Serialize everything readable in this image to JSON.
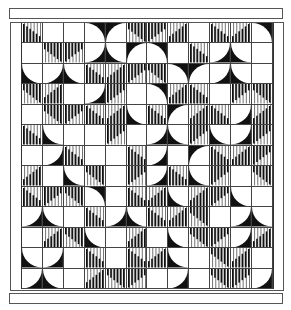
{
  "artwork": {
    "description": "Black and white geometric quilt pattern: grid of square tiles with quarter circles and vertical bar motifs",
    "columns": 12,
    "rows": 13,
    "colors": {
      "ink": "#111111",
      "paper": "#ffffff",
      "line": "#444444"
    },
    "tile_legend": {
      "0": "blank",
      "1": "quarter-circle-black-corner-top-left",
      "2": "quarter-circle-black-corner-top-right",
      "3": "quarter-circle-black-corner-bottom-right",
      "4": "quarter-circle-black-corner-bottom-left",
      "5": "bars-rising-left",
      "6": "bars-rising-right",
      "7": "bars-hanging-left",
      "8": "bars-hanging-right"
    },
    "tiles": [
      [
        5,
        0,
        0,
        2,
        1,
        7,
        8,
        6,
        0,
        5,
        6,
        2
      ],
      [
        0,
        7,
        8,
        3,
        4,
        1,
        2,
        0,
        5,
        3,
        4,
        0
      ],
      [
        4,
        3,
        4,
        5,
        6,
        8,
        7,
        2,
        1,
        3,
        4,
        0
      ],
      [
        7,
        6,
        0,
        3,
        8,
        0,
        2,
        6,
        5,
        0,
        8,
        7
      ],
      [
        0,
        7,
        8,
        5,
        6,
        4,
        5,
        1,
        6,
        5,
        3,
        6
      ],
      [
        5,
        4,
        0,
        0,
        8,
        0,
        3,
        4,
        8,
        4,
        3,
        8
      ],
      [
        0,
        3,
        5,
        0,
        0,
        5,
        3,
        0,
        1,
        5,
        6,
        8
      ],
      [
        6,
        0,
        4,
        7,
        0,
        8,
        3,
        5,
        4,
        8,
        0,
        7
      ],
      [
        5,
        8,
        7,
        2,
        0,
        5,
        6,
        4,
        6,
        8,
        4,
        0
      ],
      [
        3,
        4,
        0,
        5,
        3,
        4,
        5,
        6,
        7,
        0,
        3,
        4
      ],
      [
        0,
        6,
        7,
        4,
        0,
        6,
        0,
        4,
        7,
        8,
        3,
        6
      ],
      [
        4,
        3,
        0,
        5,
        0,
        5,
        6,
        4,
        0,
        7,
        6,
        0
      ],
      [
        3,
        4,
        0,
        6,
        7,
        8,
        0,
        3,
        0,
        7,
        8,
        3
      ]
    ]
  }
}
